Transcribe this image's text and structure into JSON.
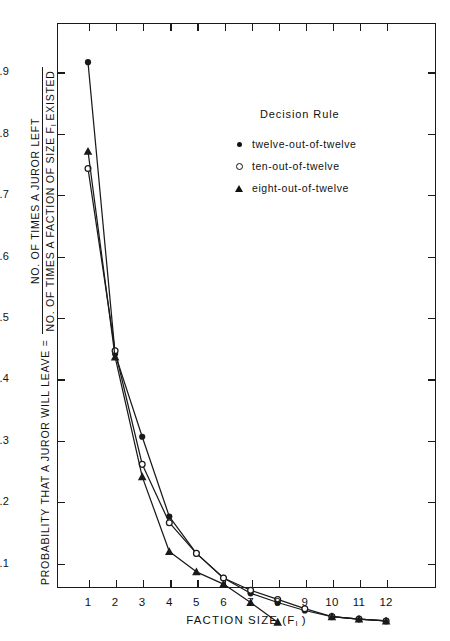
{
  "axes": {
    "y_title_lead": "PROBABILITY THAT A JUROR WILL LEAVE  =",
    "y_title_numerator": "NO. OF TIMES A JUROR LEFT",
    "y_title_denominator_pre": "NO. OF TIMES A FACTION OF SIZE F",
    "y_title_denominator_sub": "I",
    "y_title_denominator_post": " EXISTED",
    "x_title_pre": "FACTION SIZE (F",
    "x_title_sub": "I",
    "x_title_post": " )",
    "y_ticklabels": [
      ".9",
      ".8",
      ".7",
      ".6",
      ".5",
      ".4",
      ".3",
      ".2",
      ".1"
    ],
    "y_tickvalues": [
      0.9,
      0.8,
      0.7,
      0.6,
      0.5,
      0.4,
      0.3,
      0.2,
      0.1
    ],
    "x_ticklabels": [
      "1",
      "2",
      "3",
      "4",
      "5",
      "6",
      "7",
      "8",
      "9",
      "10",
      "11",
      "12"
    ]
  },
  "legend": {
    "title": "Decision  Rule",
    "items": [
      {
        "marker": "filled-circle-marker",
        "label": "twelve-out-of-twelve"
      },
      {
        "marker": "open-circle-marker",
        "label": "ten-out-of-twelve"
      },
      {
        "marker": "filled-triangle-marker",
        "label": "eight-out-of-twelve"
      }
    ]
  },
  "colors": {
    "ink": "#1a1a1a",
    "background": "#ffffff"
  },
  "chart_data": {
    "type": "line",
    "title": "",
    "xlabel": "FACTION SIZE (F_I)",
    "ylabel": "PROBABILITY THAT A JUROR WILL LEAVE = NO. OF TIMES A JUROR LEFT / NO. OF TIMES A FACTION OF SIZE F_I EXISTED",
    "xlim": [
      0,
      13
    ],
    "ylim": [
      0,
      1.0
    ],
    "grid": false,
    "legend_position": "upper-right-inside",
    "x": [
      1,
      2,
      3,
      4,
      5,
      6,
      7,
      8,
      9,
      10,
      11,
      12
    ],
    "series": [
      {
        "name": "twelve-out-of-twelve",
        "marker": "filled-circle",
        "values": [
          0.915,
          0.44,
          0.305,
          0.175,
          0.115,
          0.075,
          0.05,
          0.035,
          0.022,
          0.012,
          0.008,
          0.005
        ]
      },
      {
        "name": "ten-out-of-twelve",
        "marker": "open-circle",
        "values": [
          0.742,
          0.445,
          0.26,
          0.165,
          0.115,
          0.075,
          0.055,
          0.04,
          0.025,
          0.012,
          0.008,
          0.005
        ]
      },
      {
        "name": "eight-out-of-twelve",
        "marker": "filled-triangle",
        "values": [
          0.77,
          0.435,
          0.24,
          0.118,
          0.085,
          0.065,
          0.035,
          0.003,
          null,
          0.012,
          0.008,
          0.005
        ]
      }
    ]
  }
}
